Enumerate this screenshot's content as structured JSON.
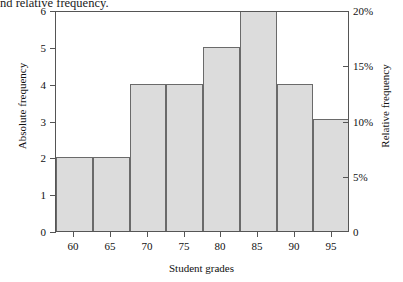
{
  "caption": {
    "text": "nd relative frequency."
  },
  "chart_data": {
    "type": "bar",
    "title": "",
    "subtitle": "",
    "xlabel": "Student grades",
    "ylabel": "Absolute frequency",
    "y2label": "Relative frequency",
    "grid": false,
    "legend": "none",
    "categories": [
      "57.5-62.5",
      "62.5-67.5",
      "67.5-72.5",
      "72.5-77.5",
      "77.5-82.5",
      "82.5-87.5",
      "87.5-92.5",
      "92.5-97.5"
    ],
    "bin_edges": [
      57.5,
      62.5,
      67.5,
      72.5,
      77.5,
      82.5,
      87.5,
      92.5,
      97.5
    ],
    "values": [
      2,
      2,
      4,
      4,
      5,
      6,
      4,
      3.05
    ],
    "relative_values_percent": [
      6.6,
      6.6,
      13.2,
      13.2,
      16.5,
      20,
      13.2,
      10
    ],
    "ylim": [
      0,
      6
    ],
    "y2lim": [
      0,
      20
    ],
    "xlim": [
      57.5,
      97.5
    ],
    "yticks": [
      "0",
      "1",
      "2",
      "3",
      "4",
      "5",
      "6"
    ],
    "ytick_values": [
      0,
      1,
      2,
      3,
      4,
      5,
      6
    ],
    "y2ticks": [
      "0",
      "5%",
      "10%",
      "15%",
      "20%"
    ],
    "y2tick_values": [
      0,
      5,
      10,
      15,
      20
    ],
    "xticks": [
      "60",
      "65",
      "70",
      "75",
      "80",
      "85",
      "90",
      "95"
    ],
    "xtick_values": [
      60,
      65,
      70,
      75,
      80,
      85,
      90,
      95
    ],
    "bar_fill_color": "#dcdcdc",
    "bar_edge_color": "#6a6a6a",
    "axis_color": "#555555"
  }
}
